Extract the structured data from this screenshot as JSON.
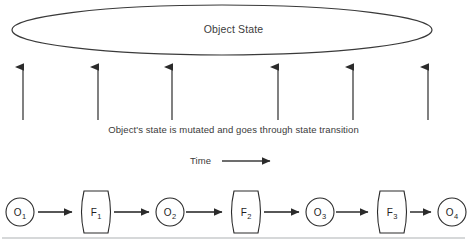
{
  "canvas": {
    "width": 467,
    "height": 249,
    "background": "#ffffff"
  },
  "diagram": {
    "object_state_label": "Object State",
    "caption": "Object's state is mutated and goes through state transition",
    "time_label": "Time",
    "colors": {
      "stroke": "#2b2b2b",
      "ellipse_stroke": "#3a3a3a",
      "arrow": "#3d3d3d",
      "text": "#2f2f2f",
      "divider": "#c9cbcd",
      "background": "#ffffff"
    }
  },
  "state_ellipse": {
    "cx": 222,
    "cy": 30,
    "rx": 210,
    "ry": 25,
    "label": "Object State"
  },
  "mutation_arrows": {
    "count": 6,
    "direction": "up",
    "y_top": 60,
    "y_bottom": 120,
    "x_positions": [
      23,
      98,
      172,
      278,
      353,
      428
    ]
  },
  "time_axis": {
    "label": "Time",
    "arrow_x_start": 222,
    "arrow_x_end": 275,
    "arrow_y": 161
  },
  "flow": {
    "baseline_y": 212,
    "nodes": [
      {
        "id": "O1",
        "kind": "object",
        "letter": "O",
        "index": "1",
        "cx": 20,
        "cy": 212,
        "r": 14
      },
      {
        "id": "F1",
        "kind": "function",
        "letter": "F",
        "index": "1",
        "cx": 96,
        "cy": 212,
        "w": 32,
        "h": 42
      },
      {
        "id": "O2",
        "kind": "object",
        "letter": "O",
        "index": "2",
        "cx": 170,
        "cy": 212,
        "r": 14
      },
      {
        "id": "F2",
        "kind": "function",
        "letter": "F",
        "index": "2",
        "cx": 246,
        "cy": 212,
        "w": 32,
        "h": 42
      },
      {
        "id": "O3",
        "kind": "object",
        "letter": "O",
        "index": "3",
        "cx": 320,
        "cy": 212,
        "r": 14
      },
      {
        "id": "F3",
        "kind": "function",
        "letter": "F",
        "index": "3",
        "cx": 392,
        "cy": 212,
        "w": 32,
        "h": 42
      },
      {
        "id": "O4",
        "kind": "object",
        "letter": "O",
        "index": "4",
        "cx": 452,
        "cy": 212,
        "r": 14
      }
    ],
    "edges": [
      {
        "from": "O1",
        "to": "F1",
        "x1": 38,
        "x2": 78
      },
      {
        "from": "F1",
        "to": "O2",
        "x1": 114,
        "x2": 154
      },
      {
        "from": "O2",
        "to": "F2",
        "x1": 186,
        "x2": 228
      },
      {
        "from": "F2",
        "to": "O3",
        "x1": 264,
        "x2": 304
      },
      {
        "from": "O3",
        "to": "F3",
        "x1": 336,
        "x2": 374
      },
      {
        "from": "F3",
        "to": "O4",
        "x1": 410,
        "x2": 436
      }
    ]
  },
  "bottom_divider": {
    "y": 238,
    "x1": 2,
    "x2": 465
  }
}
